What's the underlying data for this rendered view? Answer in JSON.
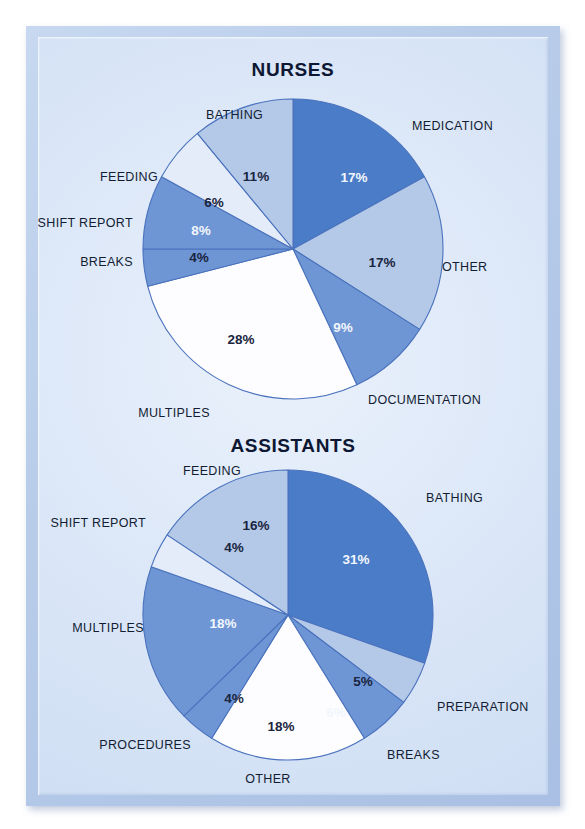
{
  "page": {
    "background": "#ffffff",
    "panel_border_color": "#b9cdea",
    "panel_fill": "#dde8f8"
  },
  "palette": {
    "dark_blue": "#4a7cc7",
    "mid_blue": "#6e95d4",
    "light_blue": "#b4c9e8",
    "pale_blue": "#e4ecf9",
    "white": "#fdfdff",
    "outline": "#4a72bd",
    "label_text": "#121c33",
    "value_text_dark": "#1a2540",
    "value_text_light": "#f2f6fd"
  },
  "chart_data": [
    {
      "type": "pie",
      "title": "NURSES",
      "xlabel": "",
      "ylabel": "",
      "legend": "none",
      "grid": false,
      "start_angle_deg": 0,
      "direction": "clockwise",
      "categories": [
        "MEDICATION",
        "OTHER",
        "DOCUMENTATION",
        "MULTIPLES",
        "BREAKS",
        "SHIFT REPORT",
        "FEEDING",
        "BATHING"
      ],
      "values": [
        17,
        17,
        9,
        28,
        4,
        8,
        6,
        11
      ],
      "value_labels": [
        "17%",
        "17%",
        "9%",
        "28%",
        "4%",
        "8%",
        "6%",
        "11%"
      ],
      "slice_colors": [
        "#4a7cc7",
        "#b4c9e8",
        "#6e95d4",
        "#fdfdff",
        "#6e95d4",
        "#6e95d4",
        "#e4ecf9",
        "#b4c9e8"
      ],
      "value_text_on_slice": [
        "light",
        "dark",
        "light",
        "dark",
        "dark",
        "light",
        "dark",
        "dark"
      ]
    },
    {
      "type": "pie",
      "title": "ASSISTANTS",
      "xlabel": "",
      "ylabel": "",
      "legend": "none",
      "grid": false,
      "start_angle_deg": 0,
      "direction": "clockwise",
      "categories": [
        "BATHING",
        "PREPARATION",
        "BREAKS",
        "OTHER",
        "PROCEDURES",
        "MULTIPLES",
        "SHIFT REPORT",
        "FEEDING"
      ],
      "values": [
        31,
        5,
        6,
        18,
        4,
        18,
        4,
        16
      ],
      "value_labels": [
        "31%",
        "5%",
        "6%",
        "18%",
        "4%",
        "18%",
        "4%",
        "16%"
      ],
      "slice_colors": [
        "#4a7cc7",
        "#b4c9e8",
        "#6e95d4",
        "#fdfdff",
        "#6e95d4",
        "#6e95d4",
        "#e4ecf9",
        "#b4c9e8"
      ],
      "value_text_on_slice": [
        "light",
        "dark",
        "light",
        "dark",
        "dark",
        "light",
        "dark",
        "dark"
      ]
    }
  ],
  "nurses": {
    "title": "NURSES",
    "value_labels": {
      "medication": "17%",
      "other": "17%",
      "documentation": "9%",
      "multiples": "28%",
      "breaks": "4%",
      "shift_report": "8%",
      "feeding": "6%",
      "bathing": "11%"
    },
    "category_labels": {
      "medication": "MEDICATION",
      "other": "OTHER",
      "documentation": "DOCUMENTATION",
      "multiples": "MULTIPLES",
      "breaks": "BREAKS",
      "shift_report": "SHIFT REPORT",
      "feeding": "FEEDING",
      "bathing": "BATHING"
    }
  },
  "assistants": {
    "title": "ASSISTANTS",
    "value_labels": {
      "bathing": "31%",
      "preparation": "5%",
      "breaks": "6%",
      "other": "18%",
      "procedures": "4%",
      "multiples": "18%",
      "shift_report": "4%",
      "feeding": "16%"
    },
    "category_labels": {
      "bathing": "BATHING",
      "preparation": "PREPARATION",
      "breaks": "BREAKS",
      "other": "OTHER",
      "procedures": "PROCEDURES",
      "multiples": "MULTIPLES",
      "shift_report": "SHIFT REPORT",
      "feeding": "FEEDING"
    }
  }
}
